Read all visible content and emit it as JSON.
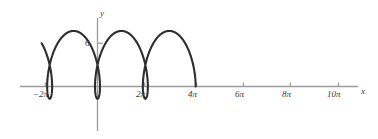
{
  "chart_data": {
    "type": "line",
    "title": "",
    "subtitle": "",
    "xlabel": "x",
    "ylabel": "y",
    "curve_name": "prolate cycloid",
    "grid": false,
    "legend": null,
    "annotations": [],
    "xtick_labels": [
      "−2π",
      "2π",
      "4π",
      "6π",
      "8π",
      "10π"
    ],
    "xtick_values": [
      -6.2832,
      6.2832,
      12.5664,
      18.8496,
      25.1327,
      31.4159
    ],
    "ytick_labels": [
      "6"
    ],
    "ytick_values": [
      6
    ],
    "xlim": [
      -10.2,
      34.6
    ],
    "ylim": [
      -3.1,
      8.6
    ],
    "series": [
      {
        "name": "prolate cycloid",
        "parametric": true,
        "param_equation_x": "t - 1.6*sin(t)",
        "param_equation_y": "3 - 1.6*3*cos(t)/3",
        "a": 3,
        "b": 4.7,
        "t_range": [
          -10.6,
          36.0
        ],
        "y_max": 7.7,
        "y_min": -1.7,
        "loop_centers_x": [
          0,
          12.5664,
          25.1327
        ],
        "cusp_crossing_y": 4.6
      }
    ],
    "curve_color": "#2e2e2e",
    "axis_color": "#9a9a9a",
    "background_color": "#ffffff"
  },
  "axes": {
    "x_axis_label": "x",
    "y_axis_label": "y",
    "y_tick_label": "6",
    "x_tick_labels": [
      {
        "text": "−2π"
      },
      {
        "text": "2π"
      },
      {
        "text": "4π"
      },
      {
        "text": "6π"
      },
      {
        "text": "8π"
      },
      {
        "text": "10π"
      }
    ]
  }
}
